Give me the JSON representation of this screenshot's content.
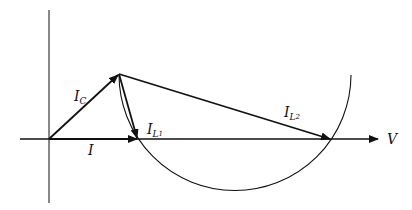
{
  "diagram": {
    "type": "phasor-diagram",
    "axes": {
      "horizontal_label": "V"
    },
    "phasors": [
      {
        "id": "I",
        "label": "I",
        "from": [
          49,
          139
        ],
        "to": [
          138,
          139
        ]
      },
      {
        "id": "IC",
        "label": "I",
        "subscript": "C",
        "from": [
          49,
          139
        ],
        "to": [
          119,
          74
        ]
      },
      {
        "id": "IL1",
        "label": "I",
        "subscript": "L",
        "subsub": "1",
        "from": [
          119,
          74
        ],
        "to": [
          138,
          139
        ]
      },
      {
        "id": "IL2",
        "label": "I",
        "subscript": "L",
        "subsub": "2",
        "from": [
          119,
          74
        ],
        "to": [
          331,
          139
        ]
      }
    ],
    "locus": {
      "shape": "circular-arc",
      "center": [
        234.5,
        73.7
      ],
      "radius": 116
    }
  },
  "labels": {
    "V": "V",
    "I": "I",
    "IC_main": "I",
    "IC_sub": "C",
    "IL1_main": "I",
    "IL1_sub": "L",
    "IL1_subsub": "1",
    "IL2_main": "I",
    "IL2_sub": "L",
    "IL2_subsub": "2"
  },
  "colors": {
    "ink": "#111111",
    "background": "#ffffff"
  }
}
